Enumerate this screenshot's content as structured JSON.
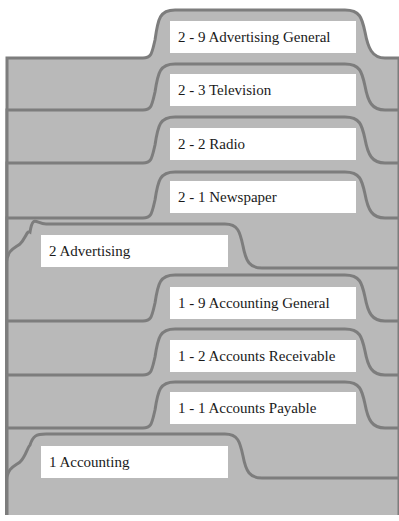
{
  "diagram": {
    "colors": {
      "folder_fill": "#b9b9b9",
      "folder_outline": "#7d7d7d",
      "label_bg": "#ffffff",
      "label_text": "#1a1a1a",
      "background": "#ffffff"
    },
    "folders": [
      {
        "id": "2-9",
        "label": "2 - 9 Advertising General",
        "level": "subfolder",
        "parent": "2 Advertising"
      },
      {
        "id": "2-3",
        "label": "2 - 3 Television",
        "level": "subfolder",
        "parent": "2 Advertising"
      },
      {
        "id": "2-2",
        "label": "2 - 2 Radio",
        "level": "subfolder",
        "parent": "2 Advertising"
      },
      {
        "id": "2-1",
        "label": "2 - 1 Newspaper",
        "level": "subfolder",
        "parent": "2 Advertising"
      },
      {
        "id": "2",
        "label": "2 Advertising",
        "level": "main"
      },
      {
        "id": "1-9",
        "label": "1 - 9 Accounting General",
        "level": "subfolder",
        "parent": "1 Accounting"
      },
      {
        "id": "1-2",
        "label": "1 - 2 Accounts Receivable",
        "level": "subfolder",
        "parent": "1 Accounting"
      },
      {
        "id": "1-1",
        "label": "1 - 1 Accounts Payable",
        "level": "subfolder",
        "parent": "1 Accounting"
      },
      {
        "id": "1",
        "label": "1 Accounting",
        "level": "main"
      }
    ]
  }
}
